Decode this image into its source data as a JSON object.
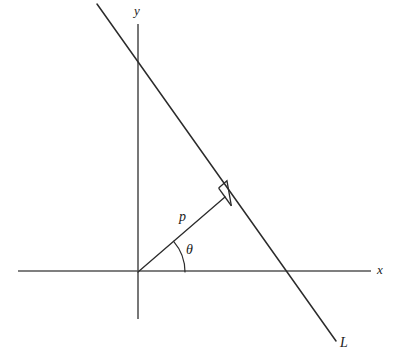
{
  "figure": {
    "type": "geometry-diagram",
    "background_color": "#ffffff",
    "axis_color": "#555555",
    "line_color": "#2b2b2b"
  },
  "labels": {
    "x_axis": "x",
    "y_axis": "y",
    "normal_length": "p",
    "angle": "θ",
    "line": "L"
  },
  "geometry": {
    "origin": {
      "x": 138,
      "y": 272
    },
    "x_axis": {
      "x1": 18,
      "y1": 271,
      "x2": 371,
      "y2": 271
    },
    "y_axis": {
      "x1": 138,
      "y1": 24,
      "x2": 138,
      "y2": 319
    },
    "line_L": {
      "x1": 97,
      "y1": 4,
      "x2": 336,
      "y2": 341
    },
    "line_L_y_intercept": {
      "x": 138,
      "y": 62
    },
    "line_L_x_intercept": {
      "x": 293,
      "y": 271
    },
    "normal_segment": {
      "x1": 138,
      "y1": 272,
      "x2": 225,
      "y2": 197
    },
    "foot_of_perpendicular": {
      "x": 225,
      "y": 197
    },
    "angle_arc_radius": 47,
    "right_angle_marker_size": 11
  },
  "label_positions": {
    "x_axis": {
      "left": 377,
      "top": 263
    },
    "y_axis": {
      "left": 134,
      "top": 4
    },
    "normal_length": {
      "left": 179,
      "top": 210
    },
    "angle": {
      "left": 186,
      "top": 243
    },
    "line": {
      "left": 340,
      "top": 336
    }
  }
}
